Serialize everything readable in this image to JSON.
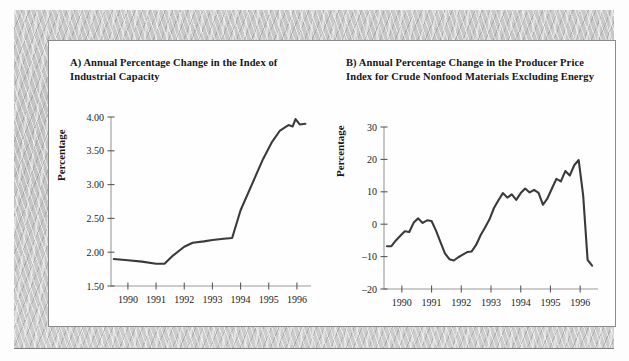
{
  "figure": {
    "panel_background": "#fefefe",
    "frame_color": "#c6c6c6",
    "line_color": "#3a3a3a"
  },
  "chart_data": [
    {
      "id": "A",
      "type": "line",
      "title": "A) Annual Percentage Change in the Index of Industrial Capacity",
      "xlabel": "",
      "ylabel": "Percentage",
      "xlim": [
        1989.4,
        1996.5
      ],
      "ylim": [
        1.5,
        4.0
      ],
      "grid": false,
      "legend": "none",
      "xticks": [
        1990,
        1991,
        1992,
        1993,
        1994,
        1995,
        1996
      ],
      "xticklabels": [
        "1990",
        "1991",
        "1992",
        "1993",
        "1994",
        "1995",
        "1996"
      ],
      "yticks": [
        1.5,
        2.0,
        2.5,
        3.0,
        3.5,
        4.0
      ],
      "yticklabels": [
        "1.50",
        "2.00",
        "2.50",
        "3.00",
        "3.50",
        "4.00"
      ],
      "series": [
        {
          "name": "Industrial capacity growth",
          "x": [
            1989.5,
            1990.0,
            1990.5,
            1991.0,
            1991.3,
            1991.6,
            1992.0,
            1992.3,
            1992.7,
            1993.0,
            1993.4,
            1993.7,
            1994.0,
            1994.4,
            1994.8,
            1995.1,
            1995.4,
            1995.7,
            1995.85,
            1995.95,
            1996.1,
            1996.3
          ],
          "y": [
            1.9,
            1.88,
            1.86,
            1.83,
            1.83,
            1.95,
            2.08,
            2.14,
            2.16,
            2.18,
            2.2,
            2.21,
            2.62,
            3.0,
            3.38,
            3.62,
            3.8,
            3.88,
            3.86,
            3.97,
            3.89,
            3.9
          ]
        }
      ]
    },
    {
      "id": "B",
      "type": "line",
      "title": "B) Annual Percentage Change in the Producer Price Index for Crude Nonfood Materials Excluding Energy",
      "xlabel": "",
      "ylabel": "Percentage",
      "xlim": [
        1989.4,
        1996.6
      ],
      "ylim": [
        -20,
        30
      ],
      "grid": false,
      "legend": "none",
      "xticks": [
        1990,
        1991,
        1992,
        1993,
        1994,
        1995,
        1996
      ],
      "xticklabels": [
        "1990",
        "1991",
        "1992",
        "1993",
        "1994",
        "1995",
        "1996"
      ],
      "yticks": [
        -20,
        -10,
        0,
        10,
        20,
        30
      ],
      "yticklabels": [
        "–20",
        "–10",
        "0",
        "10",
        "20",
        "30"
      ],
      "series": [
        {
          "name": "PPI crude nonfood materials excluding energy",
          "x": [
            1989.5,
            1989.65,
            1989.8,
            1989.95,
            1990.1,
            1990.25,
            1990.4,
            1990.55,
            1990.7,
            1990.85,
            1991.0,
            1991.15,
            1991.3,
            1991.45,
            1991.6,
            1991.75,
            1991.9,
            1992.05,
            1992.2,
            1992.35,
            1992.5,
            1992.65,
            1992.8,
            1992.95,
            1993.1,
            1993.25,
            1993.4,
            1993.55,
            1993.7,
            1993.85,
            1994.0,
            1994.15,
            1994.3,
            1994.45,
            1994.6,
            1994.75,
            1994.9,
            1995.05,
            1995.2,
            1995.35,
            1995.5,
            1995.65,
            1995.8,
            1995.95,
            1996.1,
            1996.25,
            1996.4
          ],
          "y": [
            -6.8,
            -6.8,
            -5.0,
            -3.6,
            -2.2,
            -2.4,
            0.5,
            1.8,
            0.4,
            1.2,
            1.0,
            -2.0,
            -5.5,
            -9.0,
            -10.8,
            -11.2,
            -10.2,
            -9.4,
            -8.6,
            -8.4,
            -6.4,
            -3.4,
            -1.0,
            1.5,
            5.0,
            7.4,
            9.6,
            8.2,
            9.2,
            7.5,
            9.6,
            11.0,
            9.8,
            10.6,
            9.7,
            6.0,
            8.0,
            11.0,
            14.0,
            13.2,
            16.4,
            15.0,
            18.2,
            19.8,
            9.0,
            -11.0,
            -12.8
          ]
        }
      ]
    }
  ]
}
